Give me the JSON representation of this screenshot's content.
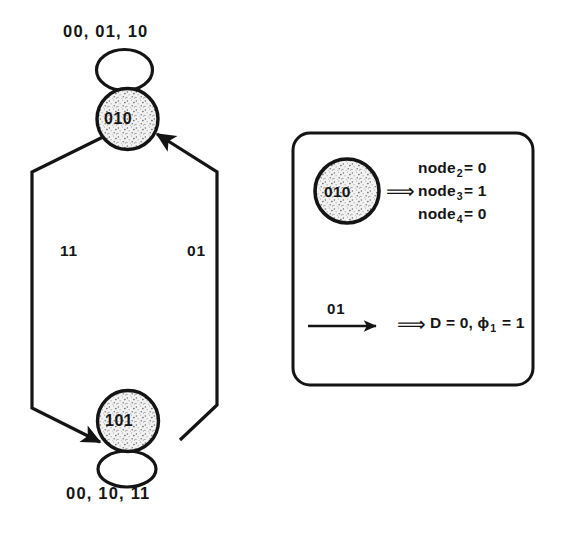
{
  "figure": {
    "type": "state-transition-diagram",
    "title": "",
    "ink_color": "#141414",
    "background_color": "#ffffff",
    "node_fill_color": "#e8e8e8"
  },
  "state_machine": {
    "states": [
      {
        "id": "s010",
        "label": "010"
      },
      {
        "id": "s101",
        "label": "101"
      }
    ],
    "self_loops": [
      {
        "state": "010",
        "label": "00, 01, 10",
        "position": "top"
      },
      {
        "state": "101",
        "label": "00, 10, 11",
        "position": "bottom"
      }
    ],
    "transitions": [
      {
        "from": "010",
        "to": "101",
        "label": "11",
        "side": "left"
      },
      {
        "from": "101",
        "to": "010",
        "label": "01",
        "side": "right"
      }
    ]
  },
  "legend": {
    "state_example": {
      "node_label": "010",
      "implies_symbol": "⟹",
      "assignments": [
        {
          "signal": "node",
          "subscript": "2",
          "equals": "= 0"
        },
        {
          "signal": "node",
          "subscript": "3",
          "equals": "= 1"
        },
        {
          "signal": "node",
          "subscript": "4",
          "equals": "= 0"
        }
      ]
    },
    "edge_example": {
      "arrow_label": "01",
      "implies_symbol": "⟹",
      "result_prefix": "D = 0, ",
      "result_symbol": "ϕ",
      "result_subscript": "1",
      "result_suffix": " = 1"
    }
  }
}
